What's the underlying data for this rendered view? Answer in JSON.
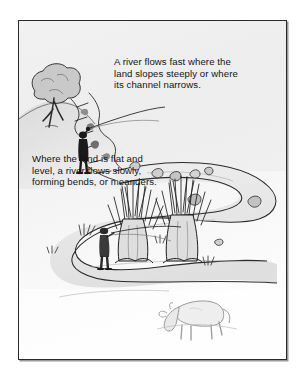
{
  "illustration": {
    "title": "River flow and meanders diagram",
    "background_color": "#ffffff",
    "plate_color": "#fdfdfd",
    "frame_color": "#2a2a2a",
    "ink_color": "#1a1a1a",
    "shade_light": "#e9e9e9",
    "shade_mid": "#cfcfcf",
    "shade_dark": "#9c9c9c"
  },
  "captions": {
    "top": "A river flows fast where the\nland slopes steeply or where\nits channel narrows.",
    "bottom": "Where the land is flat and\nlevel, a river flows slowly,\nforming bends, or meanders."
  },
  "scene": {
    "elements": [
      {
        "name": "hillside-tree",
        "label": "tree on the upland slope"
      },
      {
        "name": "rapids",
        "label": "stepped rocky rapids where the channel narrows"
      },
      {
        "name": "upper-angler",
        "label": "angler standing beside the fast water"
      },
      {
        "name": "lower-angler",
        "label": "angler standing on the meander bank"
      },
      {
        "name": "pollard-willow-left",
        "label": "pollarded willow tree"
      },
      {
        "name": "pollard-willow-right",
        "label": "pollarded willow tree"
      },
      {
        "name": "grazing-cow",
        "label": "cow grazing on the flat land"
      },
      {
        "name": "meandering-river",
        "label": "river looping in broad bends across flat land"
      },
      {
        "name": "river-rocks",
        "label": "boulders scattered in the channel"
      },
      {
        "name": "reed-tufts",
        "label": "tufts of reeds along the banks"
      }
    ]
  }
}
